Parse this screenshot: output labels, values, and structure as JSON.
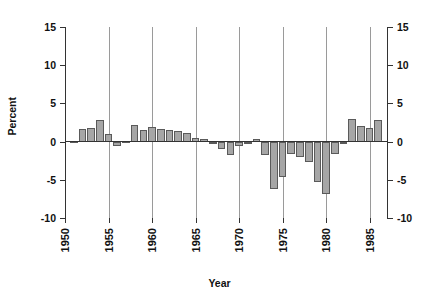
{
  "chart_data": {
    "type": "bar",
    "title": "",
    "xlabel": "Year",
    "ylabel": "Percent",
    "xlim": [
      1950,
      1987
    ],
    "ylim": [
      -10,
      15
    ],
    "ytick_values": [
      15,
      10,
      5,
      0,
      -5,
      -10
    ],
    "ytick_labels": [
      "15",
      "10",
      "5",
      "0",
      "-5",
      "-10"
    ],
    "xtick_values": [
      1950,
      1955,
      1960,
      1965,
      1970,
      1975,
      1980,
      1985
    ],
    "xtick_labels": [
      "1950",
      "1955",
      "1960",
      "1965",
      "1970",
      "1975",
      "1980",
      "1985"
    ],
    "grid": "vertical gridlines at each 5-year x tick",
    "legend": "none",
    "dual_y_axis": true,
    "bar_color": "#a6a6a6",
    "bar_edge_color": "#5a5a5a",
    "axis_color": "#333333",
    "gridline_color": "#9a9a9a",
    "categories": [
      1951,
      1952,
      1953,
      1954,
      1955,
      1956,
      1957,
      1958,
      1959,
      1960,
      1961,
      1962,
      1963,
      1964,
      1965,
      1966,
      1967,
      1968,
      1969,
      1970,
      1971,
      1972,
      1973,
      1974,
      1975,
      1976,
      1977,
      1978,
      1979,
      1980,
      1981,
      1982,
      1983,
      1984,
      1985,
      1986
    ],
    "values": [
      0.1,
      1.6,
      1.8,
      2.8,
      1.0,
      -0.6,
      0.1,
      2.2,
      1.5,
      1.9,
      1.7,
      1.5,
      1.4,
      1.1,
      0.5,
      0.4,
      -0.3,
      -1.0,
      -1.8,
      -0.6,
      0.0,
      0.4,
      -1.8,
      -6.2,
      -4.6,
      -1.6,
      -2.0,
      -2.7,
      -5.3,
      -6.8,
      -1.6,
      -0.2,
      2.9,
      2.0,
      1.8,
      2.8
    ],
    "xlabel_position": "bottom-center",
    "ylabel_position": "left-rotated"
  }
}
